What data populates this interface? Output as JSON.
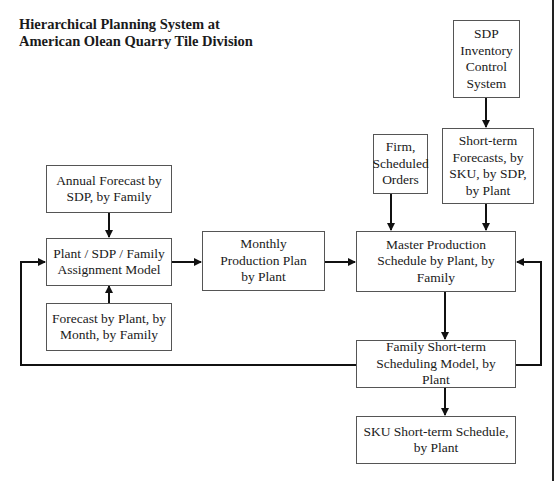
{
  "title": {
    "line1": "Hierarchical Planning System at",
    "line2": "American Olean Quarry Tile Division"
  },
  "nodes": {
    "sdp_inventory": "SDP Inventory Control System",
    "firm_orders": "Firm, Scheduled Orders",
    "short_term_forecasts": "Short-term Forecasts, by SKU, by SDP, by Plant",
    "annual_forecast": "Annual Forecast by SDP, by Family",
    "assignment_model": "Plant / SDP / Family Assignment Model",
    "forecast_by_plant": "Forecast by Plant, by Month, by Family",
    "monthly_plan": "Monthly Production Plan by Plant",
    "master_schedule": "Master Production Schedule by Plant, by Family",
    "family_scheduling": "Family Short-term Scheduling Model, by Plant",
    "sku_schedule": "SKU Short-term Schedule, by Plant"
  },
  "edges": [
    {
      "from": "sdp_inventory",
      "to": "short_term_forecasts"
    },
    {
      "from": "firm_orders",
      "to": "master_schedule"
    },
    {
      "from": "short_term_forecasts",
      "to": "master_schedule"
    },
    {
      "from": "annual_forecast",
      "to": "assignment_model"
    },
    {
      "from": "forecast_by_plant",
      "to": "assignment_model"
    },
    {
      "from": "assignment_model",
      "to": "monthly_plan"
    },
    {
      "from": "monthly_plan",
      "to": "master_schedule"
    },
    {
      "from": "master_schedule",
      "to": "family_scheduling"
    },
    {
      "from": "family_scheduling",
      "to": "sku_schedule"
    },
    {
      "from": "family_scheduling",
      "to": "assignment_model",
      "type": "feedback-left"
    },
    {
      "from": "family_scheduling",
      "to": "master_schedule",
      "type": "feedback-right"
    }
  ],
  "colors": {
    "line": "#111111",
    "box_border": "#555555",
    "background": "#ffffff"
  }
}
